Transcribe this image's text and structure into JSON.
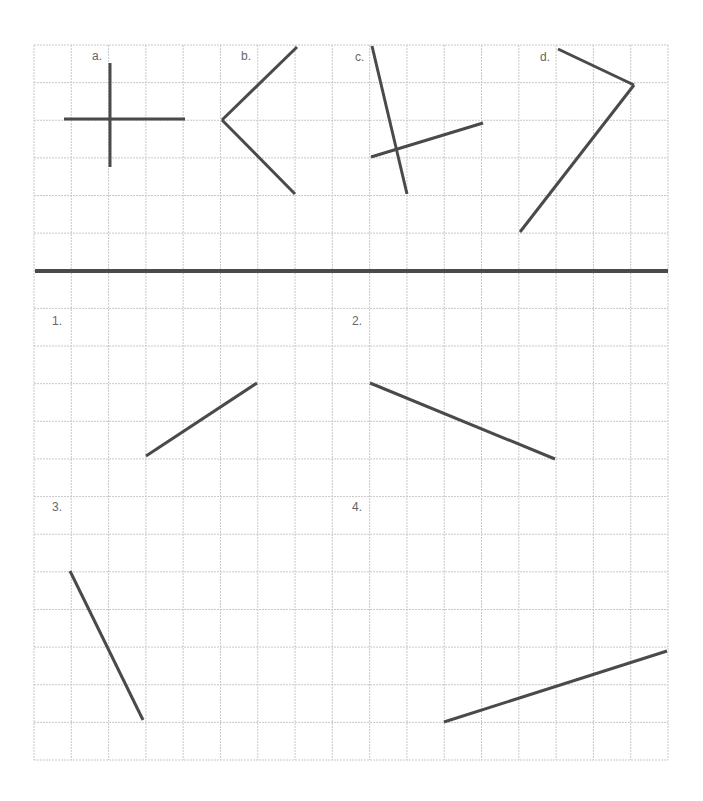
{
  "grid": {
    "left": 34,
    "top": 45,
    "right": 668,
    "bottom": 760,
    "columns": 17,
    "rows": 19,
    "line_color": "#c8c8c8",
    "stroke_color": "#4a4a4a",
    "divider": {
      "y": 271,
      "x1": 35,
      "x2": 668
    }
  },
  "top_section": {
    "figures": [
      {
        "label": "a.",
        "label_pos": [
          92,
          49
        ],
        "segments": [
          [
            [
              110,
              63
            ],
            [
              110,
              167
            ]
          ],
          [
            [
              64,
              119
            ],
            [
              185,
              119
            ]
          ]
        ]
      },
      {
        "label": "b.",
        "label_pos": [
          241,
          49
        ],
        "segments": [
          [
            [
              297,
              47
            ],
            [
              222,
              120
            ]
          ],
          [
            [
              222,
              120
            ],
            [
              295,
              194
            ]
          ]
        ]
      },
      {
        "label": "c.",
        "label_pos": [
          355,
          50
        ],
        "segments": [
          [
            [
              372,
              46
            ],
            [
              407,
              194
            ]
          ],
          [
            [
              371,
              157
            ],
            [
              483,
              123
            ]
          ]
        ]
      },
      {
        "label": "d.",
        "label_pos": [
          540,
          50
        ],
        "segments": [
          [
            [
              558,
              49
            ],
            [
              634,
              85
            ]
          ],
          [
            [
              634,
              85
            ],
            [
              520,
              232
            ]
          ]
        ]
      }
    ]
  },
  "bottom_section": {
    "problems": [
      {
        "label": "1.",
        "label_pos": [
          52,
          314
        ],
        "segments": [
          [
            [
              146,
              456
            ],
            [
              257,
              383
            ]
          ]
        ]
      },
      {
        "label": "2.",
        "label_pos": [
          352,
          314
        ],
        "segments": [
          [
            [
              370,
              383
            ],
            [
              555,
              459
            ]
          ]
        ]
      },
      {
        "label": "3.",
        "label_pos": [
          52,
          500
        ],
        "segments": [
          [
            [
              70,
              571
            ],
            [
              143,
              720
            ]
          ]
        ]
      },
      {
        "label": "4.",
        "label_pos": [
          352,
          500
        ],
        "segments": [
          [
            [
              444,
              722
            ],
            [
              667,
              651
            ]
          ]
        ]
      }
    ]
  }
}
